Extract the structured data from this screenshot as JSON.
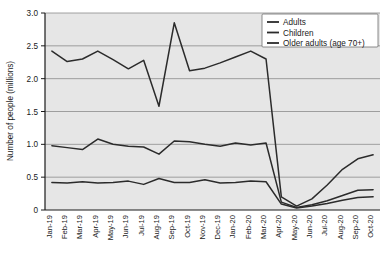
{
  "chart_data": {
    "type": "line",
    "title": "",
    "xlabel": "",
    "ylabel": "Number of people (millions)",
    "ylim": [
      0,
      3.0
    ],
    "yticks": [
      "0",
      "0.5",
      "1.0",
      "1.5",
      "2.0",
      "2.5",
      "3.0"
    ],
    "ytick_values": [
      0,
      0.5,
      1.0,
      1.5,
      2.0,
      2.5,
      3.0
    ],
    "grid": "horizontal",
    "legend_position": "top-right",
    "categories": [
      "Jan-19",
      "Feb-19",
      "Mar-19",
      "Apr-19",
      "May-19",
      "Jun-19",
      "Jul-19",
      "Aug-19",
      "Sep-19",
      "Oct-19",
      "Nov-19",
      "Dec-19",
      "Jan-20",
      "Feb-20",
      "Mar-20",
      "Apr-20",
      "May-20",
      "Jun-20",
      "Jul-20",
      "Aug-20",
      "Sep-20",
      "Oct-20"
    ],
    "series": [
      {
        "name": "Adults",
        "values": [
          2.42,
          2.26,
          2.3,
          2.42,
          2.29,
          2.15,
          2.28,
          1.58,
          2.85,
          2.12,
          2.16,
          2.24,
          2.33,
          2.42,
          2.3,
          0.2,
          0.06,
          0.17,
          0.38,
          0.62,
          0.78,
          0.84
        ]
      },
      {
        "name": "Children",
        "values": [
          0.98,
          0.95,
          0.92,
          1.08,
          1.0,
          0.97,
          0.96,
          0.85,
          1.05,
          1.04,
          1.0,
          0.97,
          1.02,
          0.99,
          1.02,
          0.12,
          0.04,
          0.08,
          0.14,
          0.22,
          0.3,
          0.31
        ]
      },
      {
        "name": "Older adults (age 70+)",
        "values": [
          0.42,
          0.41,
          0.43,
          0.41,
          0.42,
          0.44,
          0.39,
          0.48,
          0.42,
          0.42,
          0.46,
          0.41,
          0.42,
          0.44,
          0.43,
          0.09,
          0.03,
          0.06,
          0.1,
          0.15,
          0.19,
          0.2
        ]
      }
    ]
  },
  "legend": {
    "items": [
      {
        "label": "Adults"
      },
      {
        "label": "Children"
      },
      {
        "label": "Older adults (age 70+)"
      }
    ]
  }
}
